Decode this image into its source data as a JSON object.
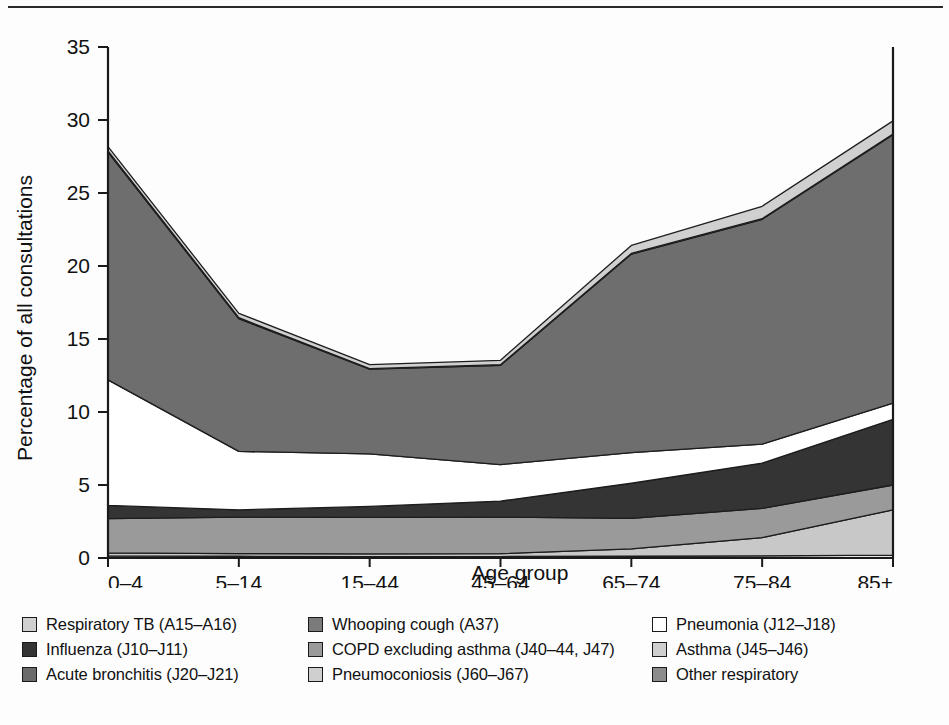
{
  "figure": {
    "background": "#fdfdfd",
    "has_top_rule": true
  },
  "chart_data": {
    "type": "area",
    "stacked": true,
    "title": "",
    "xlabel": "Age group",
    "ylabel": "Percentage of all consultations",
    "categories": [
      "0–4",
      "5–14",
      "15–44",
      "45–64",
      "65–74",
      "75–84",
      "85+"
    ],
    "x_tick_labels": [
      "0–4",
      "5–14",
      "15–44",
      "45–64",
      "65–74",
      "75–84",
      "85+"
    ],
    "y_tick_labels": [
      "0",
      "5",
      "10",
      "15",
      "20",
      "25",
      "30",
      "35"
    ],
    "y_ticks": [
      0,
      5,
      10,
      15,
      20,
      25,
      30,
      35
    ],
    "ylim": [
      0,
      35
    ],
    "grid": false,
    "legend_position": "below-axes",
    "series": [
      {
        "name": "Pneumoconiosis (J60–J67)",
        "color": "#e8e8e8",
        "values": [
          0.15,
          0.12,
          0.1,
          0.1,
          0.12,
          0.15,
          0.2
        ]
      },
      {
        "name": "Asthma (J45–J46)",
        "color": "#c8c8c8",
        "values": [
          0.2,
          0.18,
          0.18,
          0.2,
          0.5,
          1.25,
          3.1
        ]
      },
      {
        "name": "Acute bronchitis (J20–J21)",
        "color": "#9a9a9a",
        "values": [
          2.35,
          2.5,
          2.5,
          2.5,
          2.1,
          2.0,
          1.7
        ]
      },
      {
        "name": "Influenza (J10–J11)",
        "color": "#343434",
        "values": [
          0.9,
          0.5,
          0.75,
          1.1,
          2.4,
          3.1,
          4.5
        ]
      },
      {
        "name": "Pneumonia (J12–J18)",
        "color": "#ffffff",
        "values": [
          8.6,
          4.0,
          3.6,
          2.5,
          2.1,
          1.3,
          1.1
        ]
      },
      {
        "name": "COPD excluding asthma (J40–44, J47)",
        "color": "#6e6e6e",
        "values": [
          15.6,
          9.1,
          5.8,
          6.8,
          13.6,
          15.4,
          18.4
        ]
      },
      {
        "name": "Whooping cough (A37)",
        "color": "#7b7b7b",
        "values": [
          0.08,
          0.06,
          0.04,
          0.04,
          0.04,
          0.04,
          0.04
        ]
      },
      {
        "name": "Respiratory TB (A15–A16)",
        "color": "#d0d0d0",
        "values": [
          0.3,
          0.3,
          0.28,
          0.3,
          0.55,
          0.85,
          0.9
        ]
      },
      {
        "name": "Other respiratory",
        "color": "#8c8c8c",
        "values": [
          0.0,
          0.0,
          0.0,
          0.0,
          0.0,
          0.0,
          0.0
        ]
      }
    ],
    "stack_order_bottom_to_top": [
      "Pneumoconiosis (J60–J67)",
      "Asthma (J45–J46)",
      "Acute bronchitis (J20–J21)",
      "Influenza (J10–J11)",
      "Pneumonia (J12–J18)",
      "COPD excluding asthma (J40–44, J47)",
      "Whooping cough (A37)",
      "Respiratory TB (A15–A16)"
    ],
    "cumulative_totals": [
      28.18,
      16.76,
      13.25,
      13.54,
      21.41,
      24.09,
      29.94
    ]
  },
  "legend": {
    "items": [
      {
        "label": "Respiratory TB (A15–A16)",
        "color": "#d0d0d0"
      },
      {
        "label": "Influenza (J10–J11)",
        "color": "#343434"
      },
      {
        "label": "Acute bronchitis (J20–J21)",
        "color": "#6b6b6b"
      },
      {
        "label": "Whooping cough (A37)",
        "color": "#7b7b7b"
      },
      {
        "label": "COPD excluding asthma (J40–44, J47)",
        "color": "#9a9a9a"
      },
      {
        "label": "Pneumoconiosis (J60–J67)",
        "color": "#cfcfcf"
      },
      {
        "label": "Pneumonia (J12–J18)",
        "color": "#ffffff"
      },
      {
        "label": "Asthma (J45–J46)",
        "color": "#cfcfcf"
      },
      {
        "label": "Other respiratory",
        "color": "#8c8c8c"
      }
    ]
  }
}
